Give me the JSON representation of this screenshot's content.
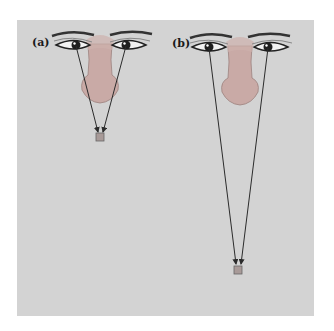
{
  "figure": {
    "panels": [
      {
        "label": "(a)",
        "description": "Eyes converging on a near object",
        "target": "near-square"
      },
      {
        "label": "(b)",
        "description": "Eyes converging on a far object",
        "target": "far-square"
      }
    ],
    "colors": {
      "background": "#d3d3d3",
      "skin": "#c9a9a6",
      "line": "#2b2b2b",
      "target": "#a89a98"
    }
  }
}
